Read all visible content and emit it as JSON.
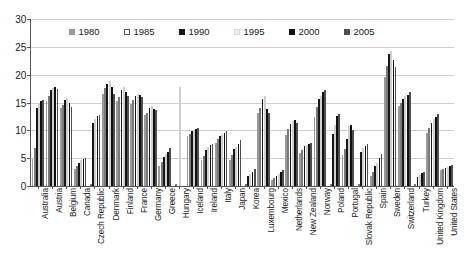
{
  "chart_data": {
    "type": "bar",
    "title": "",
    "subtitle": "",
    "xlabel": "",
    "ylabel": "",
    "ylim": [
      0,
      30
    ],
    "yticks": [
      0,
      5,
      10,
      15,
      20,
      25,
      30
    ],
    "grid": true,
    "legend_position": "top-inside",
    "categories": [
      "Australia",
      "Austria",
      "Belgium",
      "Canada",
      "Czech Republic",
      "Denmark",
      "Finland",
      "France",
      "Germany",
      "Greece",
      "Hungary",
      "Iceland",
      "Ireland",
      "Italy",
      "Japan",
      "Korea",
      "Luxembourg",
      "Mexico",
      "Netherlands",
      "New Zealand",
      "Norway",
      "Poland",
      "Portugal",
      "Slovak Republic",
      "Spain",
      "Sweden",
      "Switzerland",
      "Turkey",
      "United Kingdom",
      "United States"
    ],
    "series": [
      {
        "name": "1980",
        "color": "#9a9a9a",
        "values": [
          4.8,
          15.2,
          14.0,
          3.0,
          0.0,
          16.5,
          15.2,
          14.8,
          12.8,
          3.6,
          0.0,
          9.0,
          4.6,
          7.8,
          4.6,
          0.0,
          13.2,
          1.0,
          9.2,
          6.0,
          12.4,
          0.0,
          5.6,
          0.0,
          1.8,
          19.6,
          14.4,
          0.0,
          9.6,
          2.8
        ]
      },
      {
        "name": "1985",
        "color": "#ffffff",
        "values": [
          6.9,
          16.2,
          14.6,
          3.6,
          0.0,
          17.6,
          16.0,
          15.4,
          13.2,
          4.4,
          0.0,
          9.4,
          5.4,
          8.4,
          5.6,
          0.0,
          14.0,
          1.4,
          10.2,
          6.4,
          14.2,
          0.0,
          6.6,
          0.0,
          2.6,
          21.6,
          15.0,
          0.0,
          10.4,
          3.0
        ]
      },
      {
        "name": "1990",
        "color": "#171717",
        "values": [
          14.1,
          17.2,
          15.4,
          4.2,
          11.4,
          18.4,
          17.2,
          16.2,
          14.0,
          5.2,
          0.0,
          9.8,
          6.4,
          9.0,
          6.6,
          1.8,
          15.6,
          1.8,
          11.2,
          7.2,
          15.6,
          9.4,
          8.4,
          6.2,
          3.6,
          23.8,
          15.6,
          1.6,
          11.4,
          3.2
        ]
      },
      {
        "name": "1995",
        "color": "#e2e2e2",
        "values": [
          14.9,
          17.6,
          15.8,
          4.6,
          12.0,
          18.8,
          17.8,
          16.6,
          14.4,
          5.8,
          17.8,
          10.0,
          7.0,
          9.4,
          7.0,
          2.2,
          16.2,
          2.2,
          11.6,
          7.4,
          16.2,
          11.0,
          10.8,
          6.8,
          4.2,
          24.2,
          16.2,
          2.0,
          12.0,
          3.4
        ]
      },
      {
        "name": "2000",
        "color": "#101010",
        "values": [
          15.2,
          17.8,
          15.0,
          4.8,
          12.6,
          17.8,
          16.8,
          16.4,
          13.8,
          6.2,
          0.0,
          10.2,
          7.4,
          9.6,
          7.6,
          2.6,
          13.8,
          2.6,
          11.8,
          7.6,
          16.8,
          12.6,
          11.0,
          7.2,
          5.0,
          22.6,
          16.4,
          2.4,
          12.4,
          3.6
        ]
      },
      {
        "name": "2005",
        "color": "#4f4f4f",
        "values": [
          15.4,
          17.4,
          14.2,
          5.0,
          12.8,
          16.6,
          16.2,
          16.0,
          13.6,
          6.8,
          0.0,
          10.4,
          7.6,
          9.8,
          8.2,
          3.0,
          13.2,
          2.8,
          11.4,
          7.8,
          17.2,
          13.0,
          10.0,
          7.6,
          5.8,
          21.4,
          16.8,
          2.6,
          13.0,
          3.8
        ]
      }
    ]
  },
  "legend": {
    "items": [
      {
        "label": "1980",
        "swatch_class": "lg1980"
      },
      {
        "label": "1985",
        "swatch_class": "lg1985"
      },
      {
        "label": "1990",
        "swatch_class": "lg1990"
      },
      {
        "label": "1995",
        "swatch_class": "lg1995"
      },
      {
        "label": "2000",
        "swatch_class": "lg2000"
      },
      {
        "label": "2005",
        "swatch_class": "lg2005"
      }
    ]
  }
}
